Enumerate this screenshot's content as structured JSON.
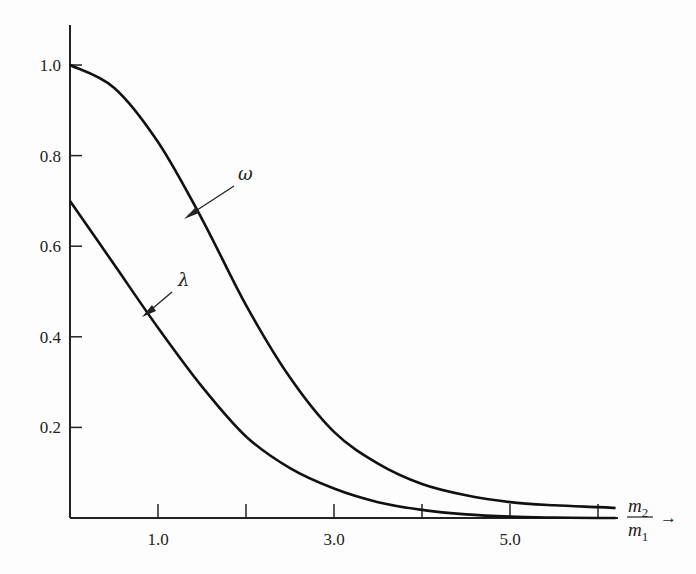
{
  "chart_data": {
    "type": "line",
    "title": "",
    "xlabel": "m2/m1 →",
    "ylabel": "",
    "xlim": [
      0,
      6.2
    ],
    "ylim": [
      0,
      1.08
    ],
    "grid": false,
    "legend": "inline arrow labels",
    "x_ticks": [
      1.0,
      2.0,
      3.0,
      4.0,
      5.0,
      6.0
    ],
    "x_tick_labels": [
      "1.0",
      "",
      "3.0",
      "",
      "5.0",
      ""
    ],
    "y_ticks": [
      0.2,
      0.4,
      0.6,
      0.8,
      1.0
    ],
    "y_tick_labels": [
      "0.2",
      "0.4",
      "0.6",
      "0.8",
      "1.0"
    ],
    "x": [
      0,
      0.5,
      1.0,
      1.5,
      2.0,
      2.5,
      3.0,
      3.5,
      4.0,
      4.5,
      5.0,
      5.5,
      6.0,
      6.2
    ],
    "series": [
      {
        "name": "ω",
        "values": [
          1.0,
          0.95,
          0.83,
          0.66,
          0.47,
          0.31,
          0.19,
          0.12,
          0.075,
          0.05,
          0.035,
          0.028,
          0.024,
          0.022
        ]
      },
      {
        "name": "λ",
        "values": [
          0.7,
          0.56,
          0.42,
          0.29,
          0.18,
          0.11,
          0.065,
          0.035,
          0.018,
          0.008,
          0.003,
          0.001,
          0.0,
          0.0
        ]
      }
    ],
    "annotations": [
      {
        "text": "ω",
        "points_to": "upper curve near x≈1.35"
      },
      {
        "text": "λ",
        "points_to": "lower curve near x≈0.9"
      }
    ]
  },
  "labels": {
    "omega": "ω",
    "lambda": "λ",
    "x_num": "m",
    "x_num_sub": "2",
    "x_den": "m",
    "x_den_sub": "1",
    "x_arrow": "→"
  }
}
